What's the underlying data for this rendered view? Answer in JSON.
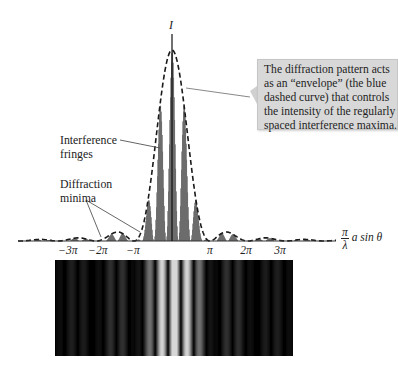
{
  "figure": {
    "intensity_axis_label": "I",
    "x_axis_label": {
      "numerator": "π",
      "denominator": "λ",
      "expression": "a sin θ"
    },
    "x_ticks": [
      {
        "label": "−3π",
        "x": 68
      },
      {
        "label": "−2π",
        "x": 98
      },
      {
        "label": "−π",
        "x": 133
      },
      {
        "label": "π",
        "x": 210
      },
      {
        "label": "2π",
        "x": 246
      },
      {
        "label": "3π",
        "x": 280
      }
    ],
    "annotations": {
      "interference": {
        "line1": "Interference",
        "line2": "fringes"
      },
      "diffraction": {
        "line1": "Diffraction",
        "line2": "minima"
      }
    },
    "callout": {
      "lines": [
        "The diffraction pattern acts",
        "as an “envelope” (the blue",
        "dashed curve) that controls",
        "the intensity of the regularly",
        "spaced interference maxima."
      ]
    },
    "colors": {
      "fringes": "#444444",
      "envelope": "#1a1a1a",
      "callout_bg": "#d8d8d8",
      "strip_bg": "#000000"
    }
  },
  "chart_data": {
    "type": "line",
    "title": "",
    "xlabel": "(π/λ) a sin θ",
    "ylabel": "I",
    "x_ticks": [
      "−3π",
      "−2π",
      "−π",
      "π",
      "2π",
      "3π"
    ],
    "series": [
      {
        "name": "Diffraction envelope (dashed)",
        "description": "sinc² envelope, central max at 0, first minima at ±π"
      },
      {
        "name": "Interference fringes",
        "description": "regularly spaced maxima modulated by the envelope"
      }
    ],
    "annotations": [
      "Interference fringes",
      "Diffraction minima",
      "I"
    ]
  }
}
